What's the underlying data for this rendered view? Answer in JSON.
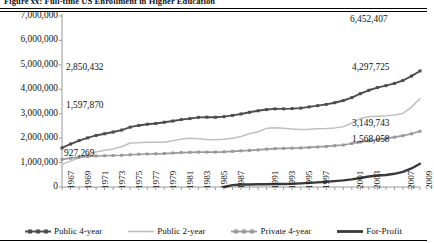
{
  "figure": {
    "title": "Figure xx: Full-time US Enrollment in Higher Education"
  },
  "chart_data": {
    "type": "line",
    "title": "Figure xx: Full-time US Enrollment in Higher Education",
    "xlabel": "",
    "ylabel": "",
    "ylim": [
      0,
      7000000
    ],
    "yticks": [
      0,
      1000000,
      2000000,
      3000000,
      4000000,
      5000000,
      6000000,
      7000000
    ],
    "ytick_labels": [
      "0",
      "1,000,000",
      "2,000,000",
      "3,000,000",
      "4,000,000",
      "5,000,000",
      "6,000,000",
      "7,000,000"
    ],
    "grid": false,
    "legend_position": "bottom",
    "x": [
      1967,
      1968,
      1969,
      1970,
      1971,
      1972,
      1973,
      1974,
      1975,
      1976,
      1977,
      1978,
      1979,
      1980,
      1981,
      1982,
      1983,
      1984,
      1985,
      1986,
      1987,
      1988,
      1989,
      1990,
      1991,
      1992,
      1993,
      1994,
      1995,
      1996,
      1997,
      1998,
      1999,
      2000,
      2001,
      2002,
      2003,
      2004,
      2005,
      2006,
      2007,
      2008,
      2009
    ],
    "xtick_labels": [
      "1967",
      "1969",
      "1971",
      "1973",
      "1975",
      "1977",
      "1979",
      "1981",
      "1983",
      "1985",
      "1987",
      "1991",
      "1993",
      "1995",
      "1997",
      "2001",
      "2003",
      "2007",
      "2009"
    ],
    "series": [
      {
        "name": "Public 4-year",
        "color": "#4d4d4d",
        "marker": "square",
        "values": [
          1597870,
          1760000,
          1900000,
          2010000,
          2110000,
          2180000,
          2250000,
          2330000,
          2450000,
          2520000,
          2570000,
          2600000,
          2650000,
          2700000,
          2760000,
          2800000,
          2850432,
          2860000,
          2855000,
          2880000,
          2930000,
          2990000,
          3060000,
          3120000,
          3170000,
          3200000,
          3200000,
          3210000,
          3230000,
          3280000,
          3330000,
          3380000,
          3450000,
          3540000,
          3660000,
          3820000,
          3960000,
          4070000,
          4150000,
          4240000,
          4360000,
          4540000,
          4750000
        ]
      },
      {
        "name": "Public 2-year",
        "color": "#bfbfbf",
        "marker": "none",
        "values": [
          927269,
          1060000,
          1200000,
          1330000,
          1430000,
          1500000,
          1560000,
          1650000,
          1800000,
          1810000,
          1830000,
          1830000,
          1830000,
          1890000,
          1960000,
          2000000,
          1980000,
          1940000,
          1930000,
          1950000,
          2000000,
          2070000,
          2180000,
          2260000,
          2400000,
          2430000,
          2400000,
          2370000,
          2350000,
          2360000,
          2380000,
          2390000,
          2420000,
          2470000,
          2620000,
          2800000,
          2880000,
          2900000,
          2920000,
          2950000,
          3010000,
          3270000,
          3620000
        ]
      },
      {
        "name": "Private 4-year",
        "color": "#999999",
        "marker": "square",
        "values": [
          1130000,
          1180000,
          1220000,
          1250000,
          1270000,
          1280000,
          1290000,
          1300000,
          1320000,
          1340000,
          1350000,
          1360000,
          1370000,
          1390000,
          1410000,
          1420000,
          1430000,
          1430000,
          1430000,
          1440000,
          1460000,
          1480000,
          1500000,
          1520000,
          1550000,
          1570000,
          1580000,
          1590000,
          1600000,
          1620000,
          1640000,
          1660000,
          1690000,
          1720000,
          1780000,
          1840000,
          1890000,
          1940000,
          1990000,
          2040000,
          2100000,
          2180000,
          2280000
        ]
      },
      {
        "name": "For-Profit",
        "color": "#3a3a3a",
        "marker": "none",
        "values": [
          null,
          null,
          null,
          null,
          null,
          null,
          null,
          null,
          null,
          null,
          null,
          null,
          null,
          null,
          null,
          null,
          null,
          null,
          null,
          0,
          75000,
          100000,
          105000,
          110000,
          115000,
          120000,
          125000,
          130000,
          150000,
          170000,
          190000,
          215000,
          240000,
          270000,
          310000,
          370000,
          430000,
          470000,
          490000,
          540000,
          620000,
          760000,
          950000
        ]
      }
    ],
    "annotations": [
      {
        "text": "2,850,432",
        "series": "Public 4-year",
        "x": 1983,
        "value": 2850432
      },
      {
        "text": "1,597,870",
        "series": "Public 4-year",
        "x": 1967,
        "value": 1597870
      },
      {
        "text": "927,269",
        "series": "Public 2-year",
        "x": 1967,
        "value": 927269
      },
      {
        "text": "6,452,407",
        "series": "Public 4-year",
        "x": 2009,
        "value": 6452407
      },
      {
        "text": "4,297,725",
        "series": "Public 2-year",
        "x": 2009,
        "value": 4297725
      },
      {
        "text": "3,149,743",
        "series": "Private 4-year",
        "x": 2009,
        "value": 3149743
      },
      {
        "text": "1,568,058",
        "series": "For-Profit",
        "x": 2009,
        "value": 1568058
      }
    ]
  }
}
